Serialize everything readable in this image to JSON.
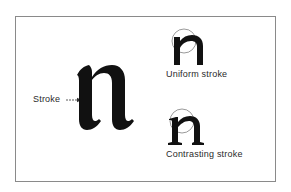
{
  "diagram": {
    "main_example": {
      "glyph": "n",
      "callout_label": "Stroke"
    },
    "examples": [
      {
        "glyph": "n",
        "caption": "Uniform stroke"
      },
      {
        "glyph": "n",
        "caption": "Contrasting stroke"
      }
    ],
    "colors": {
      "ink": "#111111",
      "frame": "#8a8a8a",
      "background": "#ffffff"
    }
  }
}
